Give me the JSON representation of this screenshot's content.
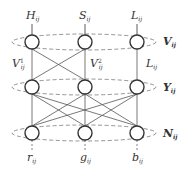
{
  "diagram": {
    "type": "layered-network",
    "colors": {
      "stroke": "#333333",
      "edge": "#555555",
      "dashed": "#888888",
      "background": "#ffffff"
    },
    "layers": [
      {
        "id": "V",
        "side_label": "V",
        "side_label_sub": "ij",
        "nodes": [
          {
            "id": "H",
            "input_label": "H",
            "input_sub": "ij"
          },
          {
            "id": "S",
            "input_label": "S",
            "input_sub": "ij"
          },
          {
            "id": "L",
            "input_label": "L",
            "input_sub": "ij"
          }
        ]
      },
      {
        "id": "Y",
        "side_label": "Y",
        "side_label_sub": "ij",
        "edge_labels": [
          {
            "text": "V",
            "sup": "1",
            "sub": "ij"
          },
          {
            "text": "V",
            "sup": "2",
            "sub": "ij"
          },
          {
            "text": "L",
            "sup": "",
            "sub": "ij"
          }
        ]
      },
      {
        "id": "N",
        "side_label": "N",
        "side_label_sub": "ij",
        "nodes": [
          {
            "id": "r",
            "output_label": "r",
            "output_sub": "ij"
          },
          {
            "id": "g",
            "output_label": "g",
            "output_sub": "ij"
          },
          {
            "id": "b",
            "output_label": "b",
            "output_sub": "ij"
          }
        ]
      }
    ],
    "edges_top_to_middle": [
      [
        0,
        0
      ],
      [
        0,
        1
      ],
      [
        1,
        0
      ],
      [
        1,
        1
      ],
      [
        2,
        2
      ]
    ],
    "edges_middle_to_bottom": [
      [
        0,
        0
      ],
      [
        0,
        1
      ],
      [
        0,
        2
      ],
      [
        1,
        0
      ],
      [
        1,
        1
      ],
      [
        1,
        2
      ],
      [
        2,
        0
      ],
      [
        2,
        1
      ],
      [
        2,
        2
      ]
    ]
  }
}
